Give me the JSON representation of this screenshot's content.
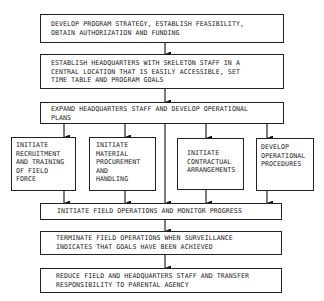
{
  "flowchart": {
    "steps": [
      {
        "id": "s1",
        "text": "DEVELOP PROGRAM STRATEGY, ESTABLISH FEASIBILITY,\nOBTAIN AUTHORIZATION AND FUNDING"
      },
      {
        "id": "s2",
        "text": "ESTABLISH HEADQUARTERS WITH SKELETON STAFF IN A\nCENTRAL LOCATION THAT IS EASILY ACCESSIBLE, SET\nTIME TABLE AND PROGRAM GOALS"
      },
      {
        "id": "s3",
        "text": "EXPAND HEADQUARTERS STAFF AND DEVELOP OPERATIONAL\nPLANS"
      },
      {
        "id": "p1",
        "text": "INITIATE\nRECRUITMENT\nAND TRAINING\nOF FIELD\nFORCE"
      },
      {
        "id": "p2",
        "text": "INITIATE\nMATERIAL\nPROCUREMENT\nAND\nHANDLING"
      },
      {
        "id": "p3",
        "text": "INITIATE\nCONTRACTUAL\nARRANGEMENTS"
      },
      {
        "id": "p4",
        "text": "DEVELOP\nOPERATIONAL\nPROCEDURES"
      },
      {
        "id": "s5",
        "text": "INITIATE FIELD OPERATIONS AND MONITOR PROGRESS"
      },
      {
        "id": "s6",
        "text": "TERMINATE FIELD OPERATIONS WHEN SURVEILLANCE\nINDICATES THAT GOALS HAVE BEEN ACHIEVED"
      },
      {
        "id": "s7",
        "text": "REDUCE FIELD AND HEADQUARTERS STAFF AND TRANSFER\nRESPONSIBILITY TO PARENTAL AGENCY"
      }
    ]
  }
}
